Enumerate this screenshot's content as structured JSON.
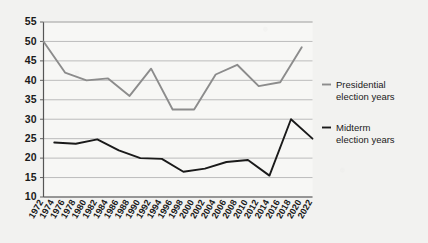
{
  "chart_data": {
    "type": "line",
    "title": "",
    "subtitle": "",
    "xlabel": "",
    "ylabel": "",
    "ylim": [
      10,
      55
    ],
    "ytick_labels": [
      "55",
      "50",
      "45",
      "40",
      "35",
      "30",
      "25",
      "20",
      "15",
      "10"
    ],
    "ytick_values": [
      55,
      50,
      45,
      40,
      35,
      30,
      25,
      20,
      15,
      10
    ],
    "grid": true,
    "legend_position": "right",
    "x": [
      1972,
      1974,
      1976,
      1978,
      1980,
      1982,
      1984,
      1986,
      1988,
      1990,
      1992,
      1994,
      1996,
      1998,
      2000,
      2002,
      2004,
      2006,
      2008,
      2010,
      2012,
      2014,
      2016,
      2018,
      2020,
      2022
    ],
    "xtick_labels": [
      "1972",
      "1974",
      "1976",
      "1978",
      "1980",
      "1982",
      "1984",
      "1986",
      "1988",
      "1990",
      "1992",
      "1994",
      "1996",
      "1998",
      "2000",
      "2002",
      "2004",
      "2006",
      "2008",
      "2010",
      "2012",
      "2014",
      "2016",
      "2018",
      "2020",
      "2022"
    ],
    "series": [
      {
        "name": "Presidential election years",
        "color": "#8c8c8c",
        "x": [
          1972,
          1976,
          1980,
          1984,
          1988,
          1992,
          1996,
          2000,
          2004,
          2008,
          2012,
          2016,
          2020
        ],
        "values": [
          50.0,
          42.0,
          40.0,
          40.5,
          36.0,
          43.0,
          32.5,
          32.5,
          41.5,
          44.0,
          38.5,
          39.5,
          48.5
        ]
      },
      {
        "name": "Midterm election years",
        "color": "#1a1a1a",
        "x": [
          1974,
          1978,
          1982,
          1986,
          1990,
          1994,
          1998,
          2002,
          2006,
          2010,
          2014,
          2018,
          2022
        ],
        "values": [
          24.0,
          23.7,
          24.8,
          22.0,
          20.0,
          19.8,
          16.5,
          17.3,
          19.0,
          19.5,
          15.5,
          30.0,
          25.0
        ]
      }
    ]
  },
  "legend": {
    "entries": [
      {
        "label_line1": "Presidential",
        "label_line2": "election years",
        "color": "#8c8c8c"
      },
      {
        "label_line1": "Midterm",
        "label_line2": "election years",
        "color": "#1a1a1a"
      }
    ]
  },
  "colors": {
    "background": "#f2f2f0",
    "plot_background": "#f7f7f5",
    "gridline": "#b5b5b5",
    "axis": "#555555",
    "presidential": "#8c8c8c",
    "midterm": "#1a1a1a",
    "text": "#1a1a1a"
  }
}
